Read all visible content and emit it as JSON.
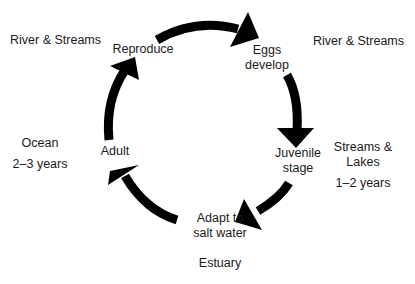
{
  "diagram": {
    "type": "life-cycle",
    "stages": [
      {
        "id": "reproduce",
        "label": "Reproduce"
      },
      {
        "id": "eggs",
        "label_line1": "Eggs",
        "label_line2": "develop"
      },
      {
        "id": "juvenile",
        "label_line1": "Juvenile",
        "label_line2": "stage"
      },
      {
        "id": "adapt",
        "label_line1": "Adapt to",
        "label_line2": "salt water"
      },
      {
        "id": "adult",
        "label": "Adult"
      }
    ],
    "habitats": [
      {
        "id": "river-left",
        "label": "River & Streams"
      },
      {
        "id": "river-right",
        "label": "River & Streams"
      },
      {
        "id": "streams-lakes",
        "label_line1": "Streams &",
        "label_line2": "Lakes",
        "duration": "1–2 years"
      },
      {
        "id": "estuary",
        "label": "Estuary"
      },
      {
        "id": "ocean",
        "label": "Ocean",
        "duration": "2–3 years"
      }
    ],
    "arrow_color": "#000000"
  }
}
